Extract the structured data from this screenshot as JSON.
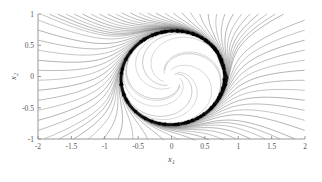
{
  "figure": {
    "kind": "phase-portrait",
    "background_color": "#ffffff",
    "axis_color": "#8c8c8c",
    "streamline_color": "#5a5a5a",
    "limit_cycle_color": "#101010",
    "arrow_color": "#000000"
  },
  "axes": {
    "x_label": "x",
    "x_label_sub": "1",
    "y_label": "x",
    "y_label_sub": "2",
    "x_ticks": [
      "-2",
      "-1.5",
      "-1",
      "-0.5",
      "0",
      "0.5",
      "1",
      "1.5",
      "2"
    ],
    "y_ticks": [
      "1",
      "0.5",
      "0",
      "-0.5",
      "-1"
    ],
    "x_tick_values": [
      -2,
      -1.5,
      -1,
      -0.5,
      0,
      0.5,
      1,
      1.5,
      2
    ],
    "y_tick_values": [
      1,
      0.5,
      0,
      -0.5,
      -1
    ],
    "xlim": [
      -2,
      2
    ],
    "ylim": [
      -1,
      1
    ],
    "tick_direction": "in",
    "box": false
  },
  "chart_data": {
    "type": "line",
    "title": "",
    "xlabel": "x1",
    "ylabel": "x2",
    "xlim": [
      -2,
      2
    ],
    "ylim": [
      -1,
      1
    ],
    "grid": false,
    "legend": "none",
    "limit_cycle": {
      "name": "stable limit cycle",
      "center": [
        0.02,
        -0.02
      ],
      "radius_x": 0.82,
      "radius_y": 0.8,
      "rotation_deg": -8,
      "direction": "clockwise",
      "line_width_px": 2.6,
      "color": "#101010"
    },
    "equilibrium": {
      "name": "unstable focus",
      "x": 0.02,
      "y": -0.02
    },
    "flow_direction": "clockwise",
    "series": [
      {
        "name": "outer-streamline-1",
        "start": [
          -1.95,
          0.98
        ]
      },
      {
        "name": "outer-streamline-2",
        "start": [
          -1.8,
          0.98
        ]
      },
      {
        "name": "outer-streamline-3",
        "start": [
          -1.65,
          0.98
        ]
      },
      {
        "name": "outer-streamline-4",
        "start": [
          -1.5,
          0.98
        ]
      },
      {
        "name": "outer-streamline-5",
        "start": [
          -1.35,
          0.98
        ]
      },
      {
        "name": "outer-streamline-6",
        "start": [
          -1.2,
          0.98
        ]
      },
      {
        "name": "outer-streamline-7",
        "start": [
          -1.05,
          0.98
        ]
      },
      {
        "name": "outer-streamline-8",
        "start": [
          -0.9,
          0.98
        ]
      },
      {
        "name": "outer-streamline-9",
        "start": [
          -0.75,
          0.98
        ]
      },
      {
        "name": "outer-streamline-10",
        "start": [
          -0.6,
          0.98
        ]
      },
      {
        "name": "outer-streamline-11",
        "start": [
          -0.45,
          0.98
        ]
      },
      {
        "name": "outer-streamline-12",
        "start": [
          -0.3,
          0.98
        ]
      },
      {
        "name": "outer-streamline-13",
        "start": [
          -0.15,
          0.98
        ]
      },
      {
        "name": "outer-streamline-14",
        "start": [
          0.0,
          0.98
        ]
      },
      {
        "name": "outer-streamline-15",
        "start": [
          0.2,
          0.98
        ]
      },
      {
        "name": "outer-streamline-16",
        "start": [
          0.4,
          0.98
        ]
      },
      {
        "name": "outer-streamline-17",
        "start": [
          0.6,
          0.98
        ]
      },
      {
        "name": "outer-streamline-18",
        "start": [
          0.8,
          0.98
        ]
      },
      {
        "name": "outer-streamline-19",
        "start": [
          1.0,
          0.98
        ]
      },
      {
        "name": "outer-streamline-20",
        "start": [
          1.2,
          0.98
        ]
      },
      {
        "name": "outer-streamline-21",
        "start": [
          1.4,
          0.98
        ]
      },
      {
        "name": "outer-streamline-22",
        "start": [
          1.6,
          0.98
        ]
      },
      {
        "name": "inner-streamline-1",
        "start": [
          0.05,
          0.04
        ]
      },
      {
        "name": "inner-streamline-2",
        "start": [
          -0.1,
          0.1
        ]
      },
      {
        "name": "inner-streamline-3",
        "start": [
          0.12,
          -0.12
        ]
      },
      {
        "name": "inner-streamline-4",
        "start": [
          -0.06,
          -0.14
        ]
      }
    ],
    "arrow_markers": {
      "count": 34,
      "shape": "filled-triangle",
      "meaning": "flow direction along streamline"
    }
  }
}
